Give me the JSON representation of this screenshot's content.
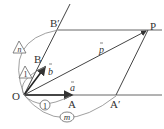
{
  "diagram": {
    "type": "vector-parallelogram",
    "points": {
      "O": {
        "label": "O",
        "x": 24,
        "y": 95
      },
      "A": {
        "label": "A",
        "x": 72,
        "y": 95
      },
      "A_prime": {
        "label": "A′",
        "x": 116,
        "y": 95
      },
      "B": {
        "label": "B",
        "x": 45,
        "y": 67
      },
      "B_prime": {
        "label": "B′",
        "x": 58,
        "y": 30
      },
      "P": {
        "label": "P",
        "x": 148,
        "y": 30
      }
    },
    "vectors": {
      "a": {
        "label": "a",
        "from": "O",
        "to": "A"
      },
      "b": {
        "label": "b",
        "from": "O",
        "to": "B"
      },
      "p": {
        "label": "p",
        "from": "O",
        "to": "P"
      }
    },
    "ratio_marks": {
      "one_bottom": "1",
      "m": "m",
      "one_triangle": "1",
      "n": "n"
    },
    "colors": {
      "line": "#444444",
      "arc": "#888888",
      "text": "#333333"
    }
  }
}
